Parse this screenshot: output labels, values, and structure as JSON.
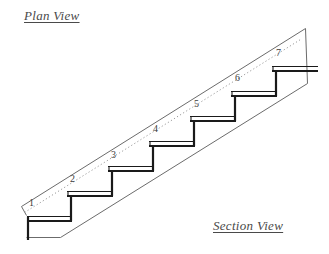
{
  "drawing": {
    "title_plan": "Plan View",
    "title_section": "Section View",
    "stroke_color": "#1a1a1a",
    "thin_stroke_color": "#6b6b6b",
    "dotted_stroke_color": "#9a9a9a",
    "background": "#ffffff",
    "step_count": 7,
    "step_numbers": [
      {
        "label": "1",
        "x": 29,
        "y": 198
      },
      {
        "label": "2",
        "x": 70,
        "y": 174
      },
      {
        "label": "3",
        "x": 111,
        "y": 150
      },
      {
        "label": "4",
        "x": 153,
        "y": 124
      },
      {
        "label": "5",
        "x": 194,
        "y": 99
      },
      {
        "label": "6",
        "x": 235,
        "y": 73
      },
      {
        "label": "7",
        "x": 276,
        "y": 48
      }
    ]
  }
}
